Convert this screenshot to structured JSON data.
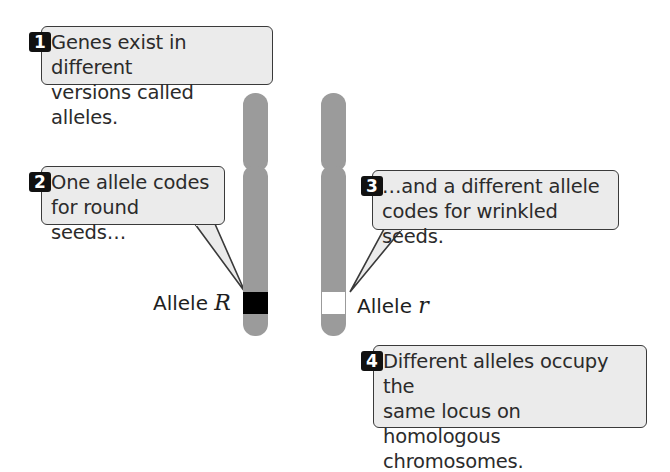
{
  "callouts": [
    {
      "number": "1",
      "line1": "Genes exist in different",
      "line2": "versions called alleles.",
      "line3": ""
    },
    {
      "number": "2",
      "line1": "One allele codes",
      "line2": "for round seeds…",
      "line3": ""
    },
    {
      "number": "3",
      "line1": "…and a different allele",
      "line2": "codes for wrinkled seeds.",
      "line3": ""
    },
    {
      "number": "4",
      "line1": "Different alleles occupy the",
      "line2": "same locus on homologous",
      "line3": "chromosomes."
    }
  ],
  "chromosomes": [
    {
      "label_prefix": "Allele",
      "allele_symbol": "R",
      "band_color": "#000000"
    },
    {
      "label_prefix": "Allele",
      "allele_symbol": "r",
      "band_color": "#ffffff"
    }
  ],
  "colors": {
    "chromosome": "#9b9b9b",
    "callout_fill": "#ebebeb",
    "callout_border": "#3a3a3a",
    "badge": "#111111"
  }
}
